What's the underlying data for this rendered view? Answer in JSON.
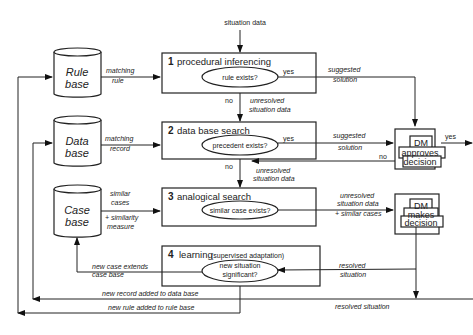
{
  "diagram": {
    "input_label": "situation data",
    "stores": [
      {
        "id": "rule",
        "line1": "Rule",
        "line2": "base",
        "edge_top": "matching",
        "edge_bottom": "rule"
      },
      {
        "id": "data",
        "line1": "Data",
        "line2": "base",
        "edge_top": "matching",
        "edge_bottom": "record"
      },
      {
        "id": "case",
        "line1": "Case",
        "line2": "base",
        "edge_top": "similar",
        "edge_mid": "cases",
        "edge_b1": "+ similarity",
        "edge_b2": "measure"
      }
    ],
    "stages": [
      {
        "num": "1",
        "title": "procedural inferencing",
        "decision": "rule exists?",
        "yes": "yes",
        "out1": "suggested",
        "out2": "solution",
        "no": "no",
        "down1": "unresolved",
        "down2": "situation data"
      },
      {
        "num": "2",
        "title": "data base search",
        "decision": "precedent exists?",
        "yes": "yes",
        "out1": "suggested",
        "out2": "solution",
        "no": "no",
        "down1": "unresolved",
        "down2": "situation data",
        "return_no": "no"
      },
      {
        "num": "3",
        "title": "analogical search",
        "decision": "similar case exists?",
        "out1": "unresolved",
        "out2": "situation data",
        "out3": "+ similar cases"
      },
      {
        "num": "4",
        "title": "learning",
        "subtitle": "(supervised adaptation)",
        "decision1": "new situation",
        "decision2": "significant?",
        "in1": "resolved",
        "in2": "situation",
        "out1": "new case extends",
        "out2": "case base"
      }
    ],
    "dm_boxes": [
      {
        "l1": "DM",
        "l2": "approves",
        "l3": "decision",
        "yes": "yes"
      },
      {
        "l1": "DM",
        "l2": "makes",
        "l3": "decision"
      }
    ],
    "feedback": {
      "record": "new record added to data base",
      "rule": "new rule added to rule base",
      "resolved": "resolved situation"
    }
  }
}
